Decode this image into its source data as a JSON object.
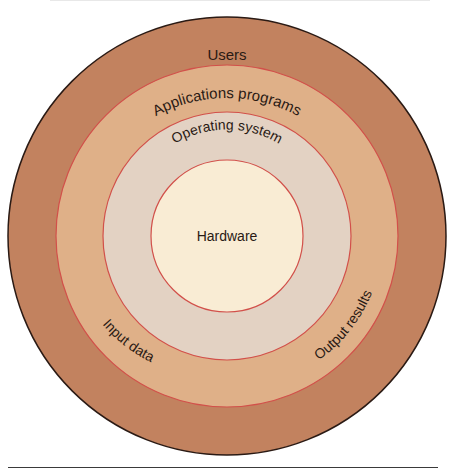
{
  "diagram": {
    "type": "concentric-layers",
    "center": [
      227,
      236
    ],
    "layers": [
      {
        "name": "users",
        "label": "Users",
        "radius": 219,
        "fill": "#c2825f",
        "stroke": "#2a1a14"
      },
      {
        "name": "applications",
        "label": "Applications programs",
        "radius": 171,
        "fill": "#dfb088",
        "stroke": "#d2504a"
      },
      {
        "name": "operating-system",
        "label": "Operating system",
        "radius": 124,
        "fill": "#e3d2c3",
        "stroke": "#d2504a"
      },
      {
        "name": "hardware",
        "label": "Hardware",
        "radius": 76,
        "fill": "#f9ecd4",
        "stroke": "#d2504a"
      }
    ],
    "flow_labels": {
      "input": "Input data",
      "output": "Output results"
    }
  }
}
